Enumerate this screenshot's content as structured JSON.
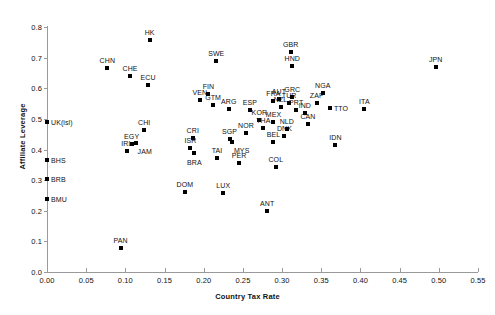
{
  "chart_data": {
    "type": "scatter",
    "title": "",
    "xlabel": "Country Tax Rate",
    "ylabel": "Affiliate Leverage",
    "xlim": [
      0.0,
      0.55
    ],
    "ylim": [
      0.0,
      0.8
    ],
    "xticks": [
      "0.00",
      "0.05",
      "0.10",
      "0.15",
      "0.20",
      "0.25",
      "0.30",
      "0.35",
      "0.40",
      "0.45",
      "0.50",
      "0.55"
    ],
    "xtick_values": [
      0.0,
      0.05,
      0.1,
      0.15,
      0.2,
      0.25,
      0.3,
      0.35,
      0.4,
      0.45,
      0.5,
      0.55
    ],
    "yticks": [
      "0.0",
      "0.1",
      "0.2",
      "0.3",
      "0.4",
      "0.5",
      "0.6",
      "0.7",
      "0.8"
    ],
    "ytick_values": [
      0.0,
      0.1,
      0.2,
      0.3,
      0.4,
      0.5,
      0.6,
      0.7,
      0.8
    ],
    "grid": false,
    "legend": null,
    "marker": "square",
    "marker_color": "#000000",
    "points": [
      {
        "label": "UK(isl)",
        "x": 0.0,
        "y": 0.49,
        "lpos": "right"
      },
      {
        "label": "BHS",
        "x": 0.0,
        "y": 0.365,
        "lpos": "right"
      },
      {
        "label": "BRB",
        "x": 0.0,
        "y": 0.305,
        "lpos": "right"
      },
      {
        "label": "BMU",
        "x": 0.0,
        "y": 0.24,
        "lpos": "right"
      },
      {
        "label": "PAN",
        "x": 0.094,
        "y": 0.077,
        "lpos": "top"
      },
      {
        "label": "CHN",
        "x": 0.077,
        "y": 0.667,
        "lpos": "top"
      },
      {
        "label": "CHE",
        "x": 0.106,
        "y": 0.641,
        "lpos": "top"
      },
      {
        "label": "ECU",
        "x": 0.129,
        "y": 0.612,
        "lpos": "top"
      },
      {
        "label": "HK",
        "x": 0.131,
        "y": 0.758,
        "lpos": "top"
      },
      {
        "label": "EGY",
        "x": 0.108,
        "y": 0.418,
        "lpos": "top"
      },
      {
        "label": "CHI",
        "x": 0.124,
        "y": 0.463,
        "lpos": "top"
      },
      {
        "label": "IRL",
        "x": 0.102,
        "y": 0.396,
        "lpos": "top"
      },
      {
        "label": "JAM",
        "x": 0.113,
        "y": 0.42,
        "lpos": "bottomright"
      },
      {
        "label": "DOM",
        "x": 0.176,
        "y": 0.262,
        "lpos": "top"
      },
      {
        "label": "CRI",
        "x": 0.186,
        "y": 0.437,
        "lpos": "top"
      },
      {
        "label": "ISR",
        "x": 0.183,
        "y": 0.404,
        "lpos": "top"
      },
      {
        "label": "BRA",
        "x": 0.188,
        "y": 0.388,
        "lpos": "bottom"
      },
      {
        "label": "VEN",
        "x": 0.195,
        "y": 0.562,
        "lpos": "top"
      },
      {
        "label": "FIN",
        "x": 0.206,
        "y": 0.582,
        "lpos": "top"
      },
      {
        "label": "GTM",
        "x": 0.212,
        "y": 0.545,
        "lpos": "top"
      },
      {
        "label": "SWE",
        "x": 0.216,
        "y": 0.69,
        "lpos": "top"
      },
      {
        "label": "ARG",
        "x": 0.232,
        "y": 0.533,
        "lpos": "top"
      },
      {
        "label": "TAI",
        "x": 0.217,
        "y": 0.372,
        "lpos": "top"
      },
      {
        "label": "SGP",
        "x": 0.233,
        "y": 0.435,
        "lpos": "top"
      },
      {
        "label": "MYS",
        "x": 0.236,
        "y": 0.423,
        "lpos": "bottomright"
      },
      {
        "label": "LUX",
        "x": 0.225,
        "y": 0.258,
        "lpos": "top"
      },
      {
        "label": "PER",
        "x": 0.245,
        "y": 0.355,
        "lpos": "top"
      },
      {
        "label": "NOR",
        "x": 0.254,
        "y": 0.455,
        "lpos": "top"
      },
      {
        "label": "ESP",
        "x": 0.259,
        "y": 0.53,
        "lpos": "top"
      },
      {
        "label": "KOR",
        "x": 0.271,
        "y": 0.497,
        "lpos": "top"
      },
      {
        "label": "THA",
        "x": 0.276,
        "y": 0.47,
        "lpos": "top"
      },
      {
        "label": "ANT",
        "x": 0.281,
        "y": 0.198,
        "lpos": "top"
      },
      {
        "label": "MEX",
        "x": 0.289,
        "y": 0.49,
        "lpos": "top"
      },
      {
        "label": "COL",
        "x": 0.292,
        "y": 0.343,
        "lpos": "top"
      },
      {
        "label": "FRA",
        "x": 0.289,
        "y": 0.558,
        "lpos": "top"
      },
      {
        "label": "AUT",
        "x": 0.296,
        "y": 0.566,
        "lpos": "top"
      },
      {
        "label": "BEL",
        "x": 0.289,
        "y": 0.423,
        "lpos": "top"
      },
      {
        "label": "NZL",
        "x": 0.298,
        "y": 0.538,
        "lpos": "top"
      },
      {
        "label": "DNK",
        "x": 0.303,
        "y": 0.443,
        "lpos": "top"
      },
      {
        "label": "NLD",
        "x": 0.306,
        "y": 0.468,
        "lpos": "top"
      },
      {
        "label": "TUR",
        "x": 0.309,
        "y": 0.552,
        "lpos": "top"
      },
      {
        "label": "GRC",
        "x": 0.313,
        "y": 0.572,
        "lpos": "top"
      },
      {
        "label": "PRT",
        "x": 0.318,
        "y": 0.528,
        "lpos": "top"
      },
      {
        "label": "IND",
        "x": 0.329,
        "y": 0.518,
        "lpos": "top"
      },
      {
        "label": "CAN",
        "x": 0.333,
        "y": 0.482,
        "lpos": "top"
      },
      {
        "label": "GBR",
        "x": 0.311,
        "y": 0.717,
        "lpos": "top"
      },
      {
        "label": "HND",
        "x": 0.313,
        "y": 0.672,
        "lpos": "top"
      },
      {
        "label": "ZAF",
        "x": 0.344,
        "y": 0.552,
        "lpos": "top"
      },
      {
        "label": "NGA",
        "x": 0.352,
        "y": 0.585,
        "lpos": "top"
      },
      {
        "label": "IDN",
        "x": 0.368,
        "y": 0.415,
        "lpos": "top"
      },
      {
        "label": "TTO",
        "x": 0.361,
        "y": 0.535,
        "lpos": "right"
      },
      {
        "label": "ITA",
        "x": 0.405,
        "y": 0.532,
        "lpos": "top"
      },
      {
        "label": "JPN",
        "x": 0.496,
        "y": 0.668,
        "lpos": "top"
      }
    ]
  }
}
